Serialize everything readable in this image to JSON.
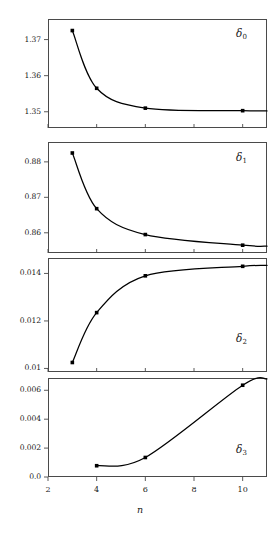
{
  "figure": {
    "background": "#ffffff",
    "line_color": "#000000",
    "marker_color": "#000000",
    "frame_color": "#4a4a4a",
    "x_axis_label": "n",
    "x_ticks": [
      2,
      4,
      6,
      8,
      10
    ],
    "x_tick_labels": [
      "2",
      "4",
      "6",
      "8",
      "10"
    ],
    "xlim": [
      2,
      11
    ]
  },
  "chart_data": [
    {
      "type": "line",
      "title": "",
      "panel_label": "δ",
      "panel_subscript": "0",
      "xlabel": "",
      "ylabel": "",
      "x": [
        3,
        4,
        6,
        10
      ],
      "values": [
        1.3725,
        1.3565,
        1.351,
        1.3503
      ],
      "y_ticks": [
        1.37,
        1.36,
        1.35
      ],
      "y_tick_labels": [
        "1.37",
        "1.36",
        "1.35"
      ],
      "ylim": [
        1.3455,
        1.3757
      ],
      "xlim": [
        2,
        11
      ],
      "grid": false,
      "legend": "none",
      "label_position": "top-right",
      "markers": true
    },
    {
      "type": "line",
      "title": "",
      "panel_label": "δ",
      "panel_subscript": "1",
      "xlabel": "",
      "ylabel": "",
      "x": [
        3,
        4,
        6,
        10
      ],
      "values": [
        0.8825,
        0.8668,
        0.8595,
        0.8565
      ],
      "y_ticks": [
        0.88,
        0.87,
        0.86
      ],
      "y_tick_labels": [
        "0.88",
        "0.87",
        "0.86"
      ],
      "ylim": [
        0.8543,
        0.8856
      ],
      "xlim": [
        2,
        11
      ],
      "grid": false,
      "legend": "none",
      "label_position": "top-right",
      "markers": true
    },
    {
      "type": "line",
      "title": "",
      "panel_label": "δ",
      "panel_subscript": "2",
      "xlabel": "",
      "ylabel": "",
      "x": [
        3,
        4,
        6,
        10
      ],
      "values": [
        0.01025,
        0.01235,
        0.0139,
        0.0143
      ],
      "y_ticks": [
        0.014,
        0.012,
        0.01
      ],
      "y_tick_labels": [
        "0.014",
        "0.012",
        "0.01"
      ],
      "ylim": [
        0.00985,
        0.01465
      ],
      "xlim": [
        2,
        11
      ],
      "grid": false,
      "legend": "none",
      "label_position": "bottom-right",
      "markers": true
    },
    {
      "type": "line",
      "title": "",
      "panel_label": "δ",
      "panel_subscript": "3",
      "xlabel": "n",
      "ylabel": "",
      "x": [
        4,
        6,
        10
      ],
      "values": [
        0.00078,
        0.00135,
        0.00635
      ],
      "y_ticks": [
        0.006,
        0.004,
        0.002,
        0.0
      ],
      "y_tick_labels": [
        "0.006",
        "0.004",
        "0.002",
        "0.0"
      ],
      "ylim": [
        0.0,
        0.00685
      ],
      "xlim": [
        2,
        11
      ],
      "grid": false,
      "legend": "none",
      "label_position": "bottom-right",
      "markers": true
    }
  ]
}
